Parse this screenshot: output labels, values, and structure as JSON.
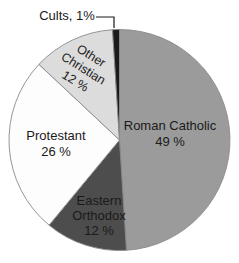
{
  "chart_data": {
    "type": "pie",
    "legend": "none",
    "background": "#ffffff",
    "border_color": "#8a8a8a",
    "label_color": "#1a1a1a",
    "order": "clockwise from 12 o'clock",
    "slices": [
      {
        "id": "roman-catholic",
        "label": "Roman Catholic",
        "value": 49,
        "pct_text": "49 %",
        "color": "#9b9b9b"
      },
      {
        "id": "eastern-orthodox",
        "label": "Eastern Orthodox",
        "value": 12,
        "pct_text": "12 %",
        "color": "#4d4d4d"
      },
      {
        "id": "protestant",
        "label": "Protestant",
        "value": 26,
        "pct_text": "26 %",
        "color": "#fdfdfd"
      },
      {
        "id": "other-christian",
        "label": "Other Christian",
        "value": 12,
        "pct_text": "12 %",
        "color": "#dcdcdc"
      },
      {
        "id": "cults",
        "label": "Cults",
        "value": 1,
        "callout_text": "Cults, 1%",
        "color": "#1a1a1a"
      }
    ]
  }
}
